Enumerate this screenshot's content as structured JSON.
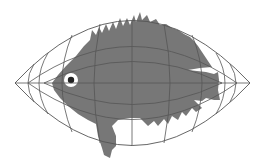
{
  "diagram": {
    "title": "Fish drawn on a curved projection grid",
    "colors": {
      "background": "#ffffff",
      "fish": "#777777",
      "grid": "#555555",
      "eye_ring": "#ffffff",
      "pupil": "#222222"
    },
    "elements": {
      "grid": "lens-shaped coordinate grid (meridians and parallels)",
      "fish": "gray fish silhouette with spiny dorsal fin",
      "eye": "white eye with dark pupil"
    }
  }
}
